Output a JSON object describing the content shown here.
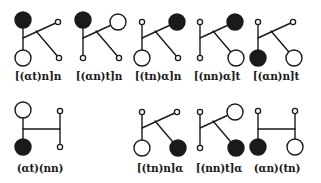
{
  "figure": {
    "node_types": {
      "filled": "large solid black circle",
      "open": "large hollow circle",
      "small": "small hollow terminal circle"
    },
    "colors": {
      "stroke": "#1a1a1a",
      "fill": "#1a1a1a",
      "background": "#ffffff"
    }
  },
  "diagrams": [
    {
      "id": "k1",
      "shape": "K",
      "label": "[(αt)n]n",
      "top": "filled",
      "bottom": "open",
      "upper_right": "small",
      "lower_right": "small",
      "x": 23,
      "y": 20,
      "label_x": 38,
      "label_y": 70
    },
    {
      "id": "k2",
      "shape": "K",
      "label": "[(αn)t]n",
      "top": "filled",
      "bottom": "small",
      "upper_right": "open",
      "lower_right": "small",
      "x": 83,
      "y": 20,
      "label_x": 99,
      "label_y": 70
    },
    {
      "id": "k3",
      "shape": "K",
      "label": "[(tn)α]n",
      "top": "small",
      "bottom": "open",
      "upper_right": "filled",
      "lower_right": "small",
      "x": 142,
      "y": 20,
      "label_x": 158,
      "label_y": 70
    },
    {
      "id": "k4",
      "shape": "K",
      "label": "[(nn)α]t",
      "top": "small",
      "bottom": "small",
      "upper_right": "filled",
      "lower_right": "open",
      "x": 200,
      "y": 20,
      "label_x": 217,
      "label_y": 70
    },
    {
      "id": "k5",
      "shape": "K",
      "label": "[(αn)n]t",
      "top": "small",
      "bottom": "filled",
      "upper_right": "small",
      "lower_right": "open",
      "x": 258,
      "y": 20,
      "label_x": 276,
      "label_y": 70
    },
    {
      "id": "h1",
      "shape": "H",
      "label": "(αt)(nn)",
      "left_top": "open",
      "left_bottom": "filled",
      "right_top": "small",
      "right_bottom": "small",
      "x": 23,
      "y": 110,
      "label_x": 40,
      "label_y": 162
    },
    {
      "id": "k6",
      "shape": "K",
      "label": "[(tn)n]α",
      "top": "small",
      "bottom": "open",
      "upper_right": "small",
      "lower_right": "filled",
      "x": 142,
      "y": 110,
      "label_x": 160,
      "label_y": 162
    },
    {
      "id": "k7",
      "shape": "K",
      "label": "[(nn)t]α",
      "top": "small",
      "bottom": "small",
      "upper_right": "open",
      "lower_right": "filled",
      "x": 200,
      "y": 110,
      "label_x": 219,
      "label_y": 162
    },
    {
      "id": "h2",
      "shape": "H",
      "label": "(αn)(tn)",
      "left_top": "small",
      "left_bottom": "filled",
      "right_top": "small",
      "right_bottom": "open",
      "x": 258,
      "y": 110,
      "label_x": 277,
      "label_y": 162
    }
  ]
}
